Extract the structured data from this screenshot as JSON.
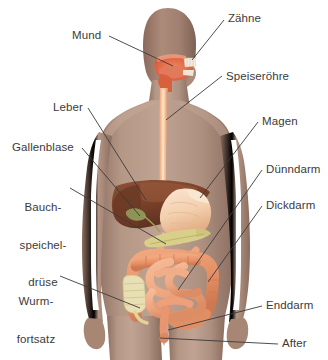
{
  "diagram": {
    "language": "de",
    "background_color": "#ffffff",
    "label_color": "#3b3b3b",
    "leader_line_color": "#3a3a3a"
  },
  "figure": {
    "body_fill": "#a7897b",
    "body_fill_light": "#b99b8c",
    "head_fill": "#9c7c6d"
  },
  "organ_colors": {
    "esophagus": "#f2b68c",
    "mouth_cavity": "#e0674a",
    "teeth": "#f3ece0",
    "liver": "#7d4630",
    "gallbladder": "#8f9456",
    "stomach": "#f6dcc2",
    "pancreas": "#d8d08a",
    "small_intestine": "#f0a883",
    "large_intestine": "#e8966f",
    "appendix": "#e9dfb4",
    "rectum": "#e8966f"
  },
  "labels": [
    {
      "id": "mund",
      "text": "Mund",
      "lines": [
        "Mund"
      ]
    },
    {
      "id": "zaehne",
      "text": "Zähne",
      "lines": [
        "Zähne"
      ]
    },
    {
      "id": "speiseroehre",
      "text": "Speiseröhre",
      "lines": [
        "Speiseröhre"
      ]
    },
    {
      "id": "leber",
      "text": "Leber",
      "lines": [
        "Leber"
      ]
    },
    {
      "id": "magen",
      "text": "Magen",
      "lines": [
        "Magen"
      ]
    },
    {
      "id": "gallenblase",
      "text": "Gallenblase",
      "lines": [
        "Gallenblase"
      ]
    },
    {
      "id": "duenndarm",
      "text": "Dünndarm",
      "lines": [
        "Dünndarm"
      ]
    },
    {
      "id": "bauchspeicheldruese",
      "text": "Bauch-speichel-drüse",
      "lines": [
        "Bauch-",
        "speichel-",
        "drüse"
      ]
    },
    {
      "id": "dickdarm",
      "text": "Dickdarm",
      "lines": [
        "Dickdarm"
      ]
    },
    {
      "id": "wurmfortsatz",
      "text": "Wurm-fortsatz",
      "lines": [
        "Wurm-",
        "fortsatz"
      ]
    },
    {
      "id": "enddarm",
      "text": "Enddarm",
      "lines": [
        "Enddarm"
      ]
    },
    {
      "id": "after",
      "text": "After",
      "lines": [
        "After"
      ]
    }
  ]
}
